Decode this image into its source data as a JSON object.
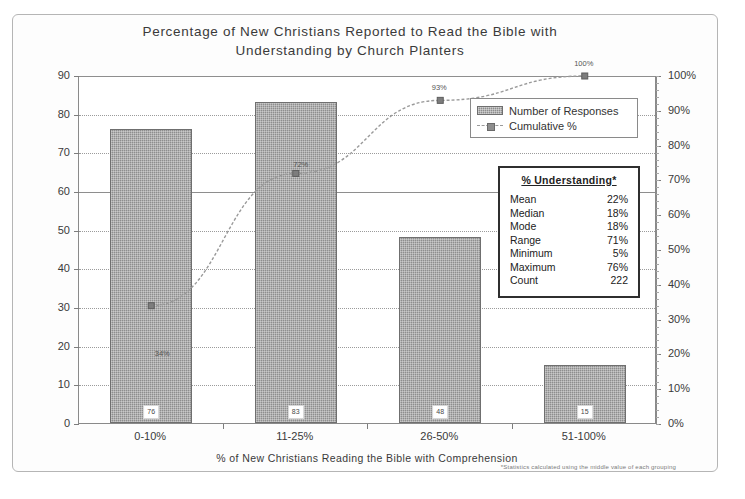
{
  "chart_data": {
    "type": "bar",
    "title": "Percentage of New Christians Reported to Read the Bible with Understanding by Church Planters",
    "title_lines": [
      "Percentage of New Christians Reported to Read the Bible with",
      "Understanding by Church Planters"
    ],
    "categories": [
      "0-10%",
      "11-25%",
      "26-50%",
      "51-100%"
    ],
    "series": [
      {
        "name": "Number of Responses",
        "type": "bar",
        "axis": "left",
        "values": [
          76,
          83,
          48,
          15
        ],
        "labels": [
          "76",
          "83",
          "48",
          "15"
        ]
      },
      {
        "name": "Cumulative %",
        "type": "line",
        "axis": "right",
        "values": [
          34,
          72,
          93,
          100
        ],
        "labels": [
          "34%",
          "72%",
          "93%",
          "100%"
        ]
      }
    ],
    "xlabel": "% of New Christians Reading the Bible with Comprehension",
    "ylabel": "",
    "ylim": [
      0,
      90
    ],
    "y_ticks": [
      "0",
      "10",
      "20",
      "30",
      "40",
      "50",
      "60",
      "70",
      "80",
      "90"
    ],
    "y2lim": [
      0,
      100
    ],
    "y2_ticks": [
      "0%",
      "10%",
      "20%",
      "30%",
      "40%",
      "50%",
      "60%",
      "70%",
      "80%",
      "90%",
      "100%"
    ],
    "grid": true,
    "legend_position": "upper-right",
    "legend": [
      "Number of Responses",
      "Cumulative %"
    ],
    "footnote": "*Statistics calculated using the middle value of each grouping",
    "colors": {
      "bar": "#8e8e8e",
      "line": "#9a9a9a",
      "axis": "#8a8a8a",
      "text": "#3a3a3a"
    }
  },
  "legend": {
    "items": [
      {
        "label": "Number of Responses",
        "marker": "bar-swatch"
      },
      {
        "label": "Cumulative %",
        "marker": "line-marker"
      }
    ]
  },
  "stats_box": {
    "heading": "% Understanding*",
    "rows": [
      {
        "key": "Mean",
        "value": "22%"
      },
      {
        "key": "Median",
        "value": "18%"
      },
      {
        "key": "Mode",
        "value": "18%"
      },
      {
        "key": "Range",
        "value": "71%"
      },
      {
        "key": "Minimum",
        "value": "5%"
      },
      {
        "key": "Maximum",
        "value": "76%"
      },
      {
        "key": "Count",
        "value": "222"
      }
    ]
  }
}
